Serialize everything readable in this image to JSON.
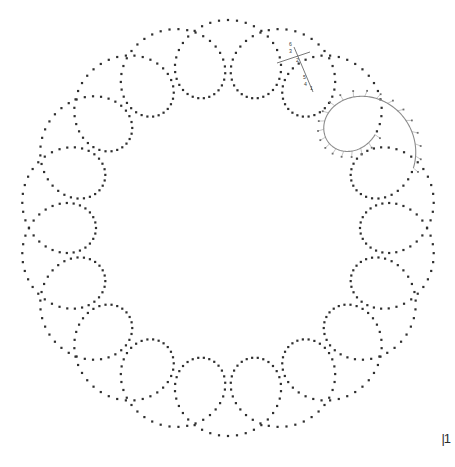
{
  "figure": {
    "background_color": "#ffffff",
    "dot_color": "#2f2f2f",
    "highlight_color": "#8c8c8c",
    "highlight_dot_color": "#6e6e6e",
    "label_color": "#3a3a3a",
    "corner_mark": "|1"
  },
  "chart_data": {
    "type": "line",
    "xlabel": "",
    "ylabel": "",
    "grid": false,
    "legend": "none",
    "xlim": [
      0,
      455
    ],
    "ylim": [
      0,
      467
    ],
    "curve": {
      "name": "epitrochoid",
      "equation": "x = cx + R*cos(t) + d*cos(k*t);  y = cy + R*sin(t) + d*sin(k*t)",
      "petals": 20,
      "center_x": 228,
      "center_y": 228,
      "radius_R": 170,
      "loop_d": 38,
      "k": 19,
      "rotation_deg": -90,
      "render": "dots",
      "dot_size_px": 2.2,
      "dot_count": 620
    },
    "highlight": {
      "petal_index": 3,
      "description": "one loop drawn solid gray with radial construction ticks and dots",
      "tick_count": 22,
      "tick_length_px": 6
    }
  },
  "construction_labels": [
    {
      "text": "6",
      "x": 289,
      "y": 46
    },
    {
      "text": "3",
      "x": 289,
      "y": 53
    },
    {
      "text": "2",
      "x": 296,
      "y": 62
    },
    {
      "text": "5",
      "x": 303,
      "y": 79
    },
    {
      "text": "4",
      "x": 304,
      "y": 86
    },
    {
      "text": "1",
      "x": 310,
      "y": 90
    }
  ]
}
